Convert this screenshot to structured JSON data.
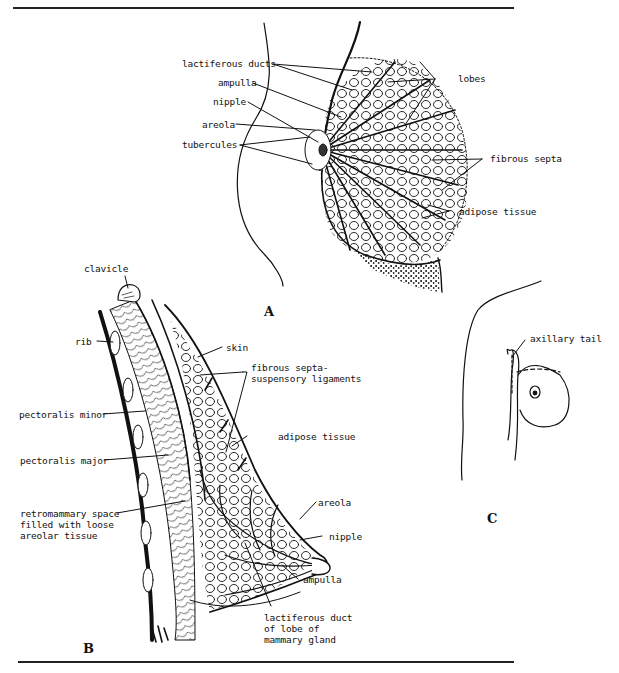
{
  "figure": {
    "panels": [
      {
        "id": "A",
        "letter": "A",
        "labels": {
          "lactiferous_ducts": "lactiferous ducts",
          "ampulla": "ampulla",
          "nipple": "nipple",
          "areola": "areola",
          "tubercules": "tubercules",
          "lobes": "lobes",
          "fibrous_septa": "fibrous septa",
          "adipose_tissue": "adipose tissue"
        }
      },
      {
        "id": "B",
        "letter": "B",
        "labels": {
          "clavicle": "clavicle",
          "rib": "rib",
          "skin": "skin",
          "fibrous_septa": "fibrous septa-\nsuspensory ligaments",
          "pectoralis_minor": "pectoralis minor",
          "adipose_tissue": "adipose tissue",
          "pectoralis_major": "pectoralis major",
          "retromammary": "retromammary space\nfilled with loose\nareolar tissue",
          "areola": "areola",
          "nipple": "nipple",
          "ampulla": "ampulla",
          "lactiferous_duct": "lactiferous duct\nof lobe of\nmammary gland"
        }
      },
      {
        "id": "C",
        "letter": "C",
        "labels": {
          "axillary_tail": "axillary tail"
        }
      }
    ]
  },
  "colors": {
    "ink": "#111111",
    "paper": "#ffffff"
  }
}
